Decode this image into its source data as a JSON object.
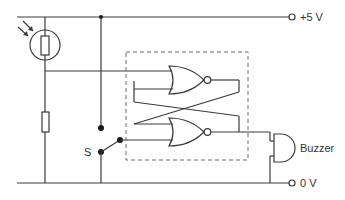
{
  "diagram": {
    "type": "circuit-schematic",
    "labels": {
      "supply_positive": "+5 V",
      "supply_ground": "0 V",
      "switch": "S",
      "buzzer": "Buzzer"
    },
    "components": [
      {
        "id": "ldr",
        "kind": "light-dependent-resistor"
      },
      {
        "id": "r1",
        "kind": "resistor"
      },
      {
        "id": "s",
        "kind": "switch",
        "label": "S"
      },
      {
        "id": "nor1",
        "kind": "NOR gate"
      },
      {
        "id": "nor2",
        "kind": "NOR gate"
      },
      {
        "id": "latch",
        "kind": "SR latch (dashed boundary)"
      },
      {
        "id": "buzzer",
        "kind": "buzzer",
        "label": "Buzzer"
      }
    ],
    "colors": {
      "wire": "#3a3a3a",
      "dashed_box": "#6a6a6a",
      "background": "#ffffff"
    }
  }
}
